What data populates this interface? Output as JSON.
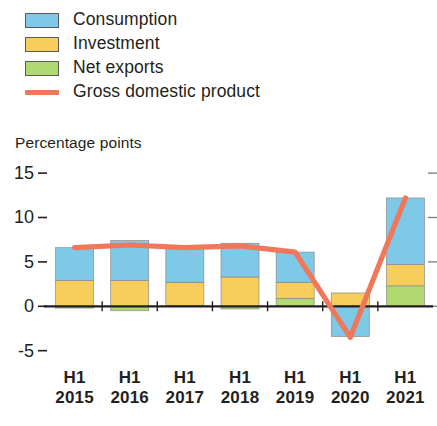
{
  "legend": {
    "items": [
      {
        "label": "Consumption",
        "color": "#7ec8e8",
        "marker": "swatch",
        "icon": "legend-swatch-consumption"
      },
      {
        "label": "Investment",
        "color": "#f7cd5b",
        "marker": "swatch",
        "icon": "legend-swatch-investment"
      },
      {
        "label": "Net exports",
        "color": "#b0d972",
        "marker": "swatch",
        "icon": "legend-swatch-net-exports"
      },
      {
        "label": "Gross domestic product",
        "color": "#f0775a",
        "marker": "line",
        "icon": "legend-line-gdp"
      }
    ]
  },
  "axis_title": "Percentage points",
  "chart_data": {
    "type": "bar",
    "title": "",
    "subtitle": "",
    "xlabel": "",
    "ylabel": "Percentage points",
    "ylim": [
      -6.5,
      15.8
    ],
    "yticks": [
      15,
      10,
      5,
      0,
      -5
    ],
    "ytick_labels": [
      "15",
      "10",
      "5",
      "0",
      "-5"
    ],
    "grid": false,
    "stacked": true,
    "legend_position": "top-left",
    "categories": [
      "H1 2015",
      "H1 2016",
      "H1 2017",
      "H1 2018",
      "H1 2019",
      "H1 2020",
      "H1 2021"
    ],
    "category_period": [
      "H1",
      "H1",
      "H1",
      "H1",
      "H1",
      "H1",
      "H1"
    ],
    "category_year": [
      "2015",
      "2016",
      "2017",
      "2018",
      "2019",
      "2020",
      "2021"
    ],
    "series": [
      {
        "name": "Consumption",
        "color": "#7ec8e8",
        "type": "bar",
        "values": [
          3.7,
          4.5,
          3.9,
          3.8,
          3.4,
          -3.4,
          7.5
        ]
      },
      {
        "name": "Investment",
        "color": "#f7cd5b",
        "type": "bar",
        "values": [
          2.9,
          2.9,
          2.6,
          3.3,
          1.8,
          1.5,
          2.4
        ]
      },
      {
        "name": "Net exports",
        "color": "#b0d972",
        "type": "bar",
        "values": [
          -0.2,
          -0.5,
          0.1,
          -0.3,
          0.9,
          0.0,
          2.3
        ]
      },
      {
        "name": "Gross domestic product",
        "color": "#f0775a",
        "type": "line",
        "values": [
          6.6,
          6.9,
          6.6,
          6.8,
          6.1,
          -3.5,
          12.2
        ]
      }
    ]
  }
}
